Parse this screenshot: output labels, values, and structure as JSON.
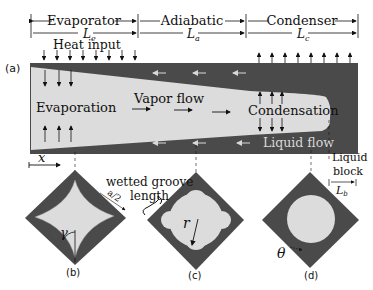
{
  "colors": {
    "wall": "#4a4a4a",
    "vapor": "#dcdcdc",
    "liquid_arrow": "#cfcfcf",
    "ink": "#111111"
  },
  "sections": {
    "evaporator": {
      "label": "Evaporator",
      "length": "L",
      "sub": "e"
    },
    "adiabatic": {
      "label": "Adiabatic",
      "length": "L",
      "sub": "a"
    },
    "condenser": {
      "label": "Condenser",
      "length": "L",
      "sub": "c"
    }
  },
  "labels": {
    "panel_a": "(a)",
    "heat_input": "Heat input",
    "evaporation": "Evaporation",
    "vapor_flow": "Vapor flow",
    "condensation": "Condensation",
    "liquid_flow": "Liquid flow",
    "x_axis": "x",
    "liquid_block_1": "Liquid",
    "liquid_block_2": "block",
    "lb": "L",
    "lb_sub": "b",
    "wetted_1": "wetted groove",
    "wetted_2": "length",
    "a_half": "a/2",
    "gamma": "γ",
    "r": "r",
    "theta": "θ",
    "panel_b": "(b)",
    "panel_c": "(c)",
    "panel_d": "(d)"
  }
}
